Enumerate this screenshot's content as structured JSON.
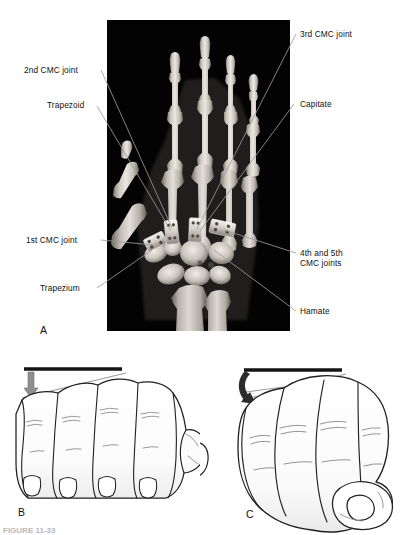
{
  "figure": {
    "panels": [
      {
        "letter": "A",
        "kind": "radiograph",
        "description": "Posteroanterior radiograph of the hand and wrist with fixation hardware at the carpometacarpal joints"
      },
      {
        "letter": "B",
        "kind": "line-drawing",
        "description": "Line drawing of an open hand, fingers extended, with a straight reference bar and a straight downward arrow"
      },
      {
        "letter": "C",
        "kind": "line-drawing",
        "description": "Line drawing of a closed fist with a straight reference bar and a curved rotation arrow"
      }
    ],
    "caption_clipped": "FIGURE 11-33"
  },
  "annotations": {
    "left": [
      {
        "id": "second-cmc-joint",
        "text": "2nd CMC joint"
      },
      {
        "id": "trapezoid",
        "text": "Trapezoid"
      },
      {
        "id": "first-cmc-joint",
        "text": "1st CMC joint"
      },
      {
        "id": "trapezium",
        "text": "Trapezium"
      }
    ],
    "right": [
      {
        "id": "third-cmc-joint",
        "text": "3rd CMC joint"
      },
      {
        "id": "capitate",
        "text": "Capitate"
      },
      {
        "id": "fourth-fifth-cmc-joints-line1",
        "text": "4th and 5th"
      },
      {
        "id": "fourth-fifth-cmc-joints-line2",
        "text": "CMC joints"
      },
      {
        "id": "hamate",
        "text": "Hamate"
      }
    ]
  },
  "panel_letters": {
    "a": "A",
    "b": "B",
    "c": "C"
  },
  "colors": {
    "xray_background": "#030303",
    "bone_light": "#e9e6e0",
    "bone_mid": "#b9b4ac",
    "bone_dark": "#6d6962",
    "leader_line": "#9a9a9a",
    "text": "#111111",
    "drawing_ink": "#1f1f1f",
    "drawing_shade": "#9a9a9a",
    "arrow_gray": "#8a8a8a",
    "bar_black": "#141414"
  }
}
